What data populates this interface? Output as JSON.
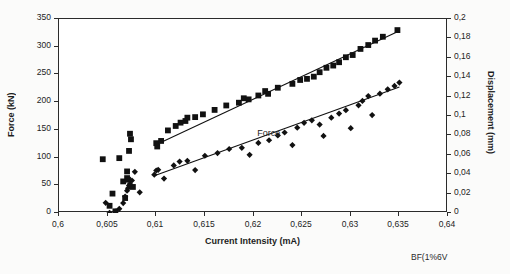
{
  "figure": {
    "caption": "BF(1%6V"
  },
  "chart_data": {
    "type": "scatter",
    "title": "",
    "xlabel": "Current Intensity (mA)",
    "ylabel": "Force (kN)",
    "y2label": "Displacement (mm)",
    "xlim": [
      0.6,
      0.64
    ],
    "ylim": [
      0,
      350
    ],
    "y2lim": [
      0,
      0.2
    ],
    "grid": false,
    "legend_position": "inline-annotation",
    "annotations": [
      {
        "text": "Force",
        "x": 0.6205,
        "y": 140
      }
    ],
    "xticks": [
      0.6,
      0.605,
      0.61,
      0.615,
      0.62,
      0.625,
      0.63,
      0.635,
      0.64
    ],
    "xticklabels": [
      "0,6",
      "0,605",
      "0,61",
      "0,615",
      "0,62",
      "0,625",
      "0,63",
      "0,635",
      "0,64"
    ],
    "yticks": [
      0,
      50,
      100,
      150,
      200,
      250,
      300,
      350
    ],
    "yticklabels": [
      "0",
      "50",
      "100",
      "150",
      "200",
      "250",
      "300",
      "350"
    ],
    "y2ticks": [
      0,
      0.02,
      0.04,
      0.06,
      0.08,
      0.1,
      0.12,
      0.14,
      0.16,
      0.18,
      0.2
    ],
    "y2ticklabels": [
      "0",
      "0,02",
      "0,04",
      "0,06",
      "0,08",
      "0,1",
      "0,12",
      "0,14",
      "0,16",
      "0,18",
      "0,2"
    ],
    "series": [
      {
        "name": "Force",
        "marker": "square",
        "axis": "left",
        "color": "#111111",
        "points": [
          [
            0.6045,
            97
          ],
          [
            0.6052,
            13
          ],
          [
            0.6055,
            35
          ],
          [
            0.6058,
            3
          ],
          [
            0.6062,
            99
          ],
          [
            0.6066,
            57
          ],
          [
            0.6068,
            27
          ],
          [
            0.607,
            75
          ],
          [
            0.607,
            63
          ],
          [
            0.6071,
            60
          ],
          [
            0.6072,
            112
          ],
          [
            0.6073,
            143
          ],
          [
            0.6074,
            133
          ],
          [
            0.6076,
            47
          ],
          [
            0.61,
            126
          ],
          [
            0.6101,
            120
          ],
          [
            0.6105,
            130
          ],
          [
            0.6112,
            149
          ],
          [
            0.612,
            157
          ],
          [
            0.6125,
            163
          ],
          [
            0.613,
            166
          ],
          [
            0.6132,
            172
          ],
          [
            0.614,
            173
          ],
          [
            0.6148,
            178
          ],
          [
            0.616,
            186
          ],
          [
            0.6172,
            194
          ],
          [
            0.6185,
            199
          ],
          [
            0.619,
            207
          ],
          [
            0.6195,
            205
          ],
          [
            0.6205,
            212
          ],
          [
            0.6212,
            220
          ],
          [
            0.6215,
            215
          ],
          [
            0.6225,
            226
          ],
          [
            0.624,
            233
          ],
          [
            0.6248,
            240
          ],
          [
            0.6255,
            242
          ],
          [
            0.6262,
            246
          ],
          [
            0.6268,
            254
          ],
          [
            0.6275,
            262
          ],
          [
            0.6282,
            266
          ],
          [
            0.6288,
            272
          ],
          [
            0.6295,
            281
          ],
          [
            0.6302,
            285
          ],
          [
            0.631,
            296
          ],
          [
            0.6318,
            303
          ],
          [
            0.6325,
            311
          ],
          [
            0.6333,
            318
          ],
          [
            0.6348,
            330
          ]
        ],
        "trendline": {
          "x0": 0.6098,
          "y0": 122,
          "x1": 0.6348,
          "y1": 327
        }
      },
      {
        "name": "Displacement",
        "marker": "diamond",
        "axis": "right",
        "color": "#111111",
        "points": [
          [
            0.6048,
            0.0105
          ],
          [
            0.6052,
            0.0002
          ],
          [
            0.6058,
            0.0015
          ],
          [
            0.6062,
            0.0043
          ],
          [
            0.6066,
            0.0102
          ],
          [
            0.6068,
            0.017
          ],
          [
            0.607,
            0.023
          ],
          [
            0.6071,
            0.0255
          ],
          [
            0.6072,
            0.0283
          ],
          [
            0.6073,
            0.03
          ],
          [
            0.6075,
            0.0335
          ],
          [
            0.6078,
            0.0425
          ],
          [
            0.6083,
            0.0213
          ],
          [
            0.6098,
            0.0395
          ],
          [
            0.61,
            0.0438
          ],
          [
            0.6102,
            0.0445
          ],
          [
            0.6108,
            0.0355
          ],
          [
            0.6118,
            0.049
          ],
          [
            0.6124,
            0.053
          ],
          [
            0.6132,
            0.0538
          ],
          [
            0.614,
            0.0443
          ],
          [
            0.615,
            0.059
          ],
          [
            0.6163,
            0.0618
          ],
          [
            0.6175,
            0.066
          ],
          [
            0.6188,
            0.0672
          ],
          [
            0.6196,
            0.06
          ],
          [
            0.6205,
            0.0722
          ],
          [
            0.6216,
            0.075
          ],
          [
            0.6225,
            0.08
          ],
          [
            0.6232,
            0.083
          ],
          [
            0.624,
            0.07
          ],
          [
            0.6245,
            0.088
          ],
          [
            0.6252,
            0.093
          ],
          [
            0.626,
            0.0955
          ],
          [
            0.6268,
            0.0912
          ],
          [
            0.6272,
            0.0795
          ],
          [
            0.628,
            0.0983
          ],
          [
            0.6288,
            0.1025
          ],
          [
            0.6295,
            0.106
          ],
          [
            0.63,
            0.0875
          ],
          [
            0.6308,
            0.111
          ],
          [
            0.6312,
            0.1155
          ],
          [
            0.6318,
            0.1205
          ],
          [
            0.6322,
            0.101
          ],
          [
            0.633,
            0.123
          ],
          [
            0.6338,
            0.1275
          ],
          [
            0.6345,
            0.131
          ],
          [
            0.635,
            0.1345
          ]
        ],
        "trendline": {
          "x0": 0.6098,
          "y0": 0.0385,
          "x1": 0.635,
          "y1": 0.13
        }
      }
    ]
  }
}
